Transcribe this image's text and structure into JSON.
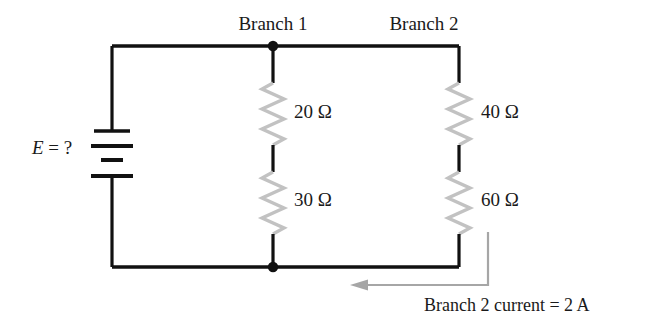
{
  "diagram": {
    "type": "electrical-circuit-schematic",
    "branch_labels": [
      {
        "text": "Branch 1",
        "x": 273,
        "y": 28
      },
      {
        "text": "Branch 2",
        "x": 424,
        "y": 28
      }
    ],
    "source": {
      "label_symbol": "E",
      "label_rest": " = ?",
      "full_label": "E = ?",
      "component": "battery",
      "plate_count": 4
    },
    "resistors": [
      {
        "name": "R1",
        "value": "20 Ω",
        "branch": "Branch 1",
        "position": "upper"
      },
      {
        "name": "R2",
        "value": "30 Ω",
        "branch": "Branch 1",
        "position": "lower"
      },
      {
        "name": "R3",
        "value": "40 Ω",
        "branch": "Branch 2",
        "position": "upper"
      },
      {
        "name": "R4",
        "value": "60 Ω",
        "branch": "Branch 2",
        "position": "lower"
      }
    ],
    "annotation": {
      "text": "Branch 2 current = 2 A",
      "arrow": "current-direction-arrow-left"
    },
    "colors": {
      "wire": "#111111",
      "resistor": "#b8b8b8",
      "arrow": "#a6a6a6",
      "text": "#1a1a1a",
      "background": "#ffffff"
    }
  }
}
